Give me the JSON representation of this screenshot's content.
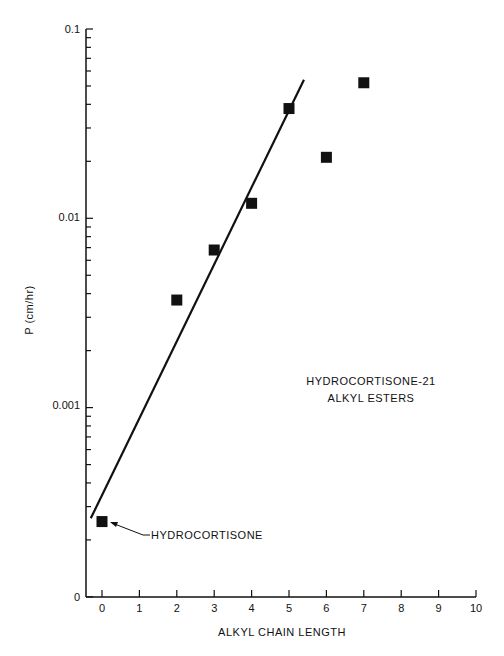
{
  "chart_data": {
    "type": "scatter",
    "title": "",
    "xlabel": "ALKYL CHAIN LENGTH",
    "ylabel": "P (cm/hr)",
    "yscale": "log",
    "xlim": [
      0,
      10
    ],
    "ylim": [
      0.0001,
      0.1
    ],
    "x_ticks": [
      "0",
      "1",
      "2",
      "3",
      "4",
      "5",
      "6",
      "7",
      "8",
      "9",
      "10"
    ],
    "y_ticks": [
      "0.1",
      "0.01",
      "0.001",
      "0"
    ],
    "grid": false,
    "series": [
      {
        "name": "Hydrocortisone-21 alkyl esters",
        "marker": "square",
        "x": [
          0,
          2,
          3,
          4,
          5,
          6,
          7
        ],
        "values": [
          0.00025,
          0.0037,
          0.0068,
          0.012,
          0.038,
          0.021,
          0.052
        ]
      }
    ],
    "fit_line": {
      "x": [
        -0.3,
        5.4
      ],
      "y": [
        0.00026,
        0.054
      ]
    },
    "annotations": [
      {
        "text": "HYDROCORTISONE",
        "points_to": [
          0,
          0.00025
        ]
      },
      {
        "text": "HYDROCORTISONE-21",
        "line": 1
      },
      {
        "text": "ALKYL ESTERS",
        "line": 2
      }
    ]
  },
  "labels": {
    "x_axis_title": "ALKYL CHAIN LENGTH",
    "y_axis_title": "P (cm/hr)",
    "legend_line1": "HYDROCORTISONE-21",
    "legend_line2": "ALKYL ESTERS",
    "arrow_label": "HYDROCORTISONE",
    "y_tick_0": "0.1",
    "y_tick_1": "0.01",
    "y_tick_2": "0.001",
    "y_tick_3": "0",
    "x_ticks": [
      "0",
      "1",
      "2",
      "3",
      "4",
      "5",
      "6",
      "7",
      "8",
      "9",
      "10"
    ]
  }
}
